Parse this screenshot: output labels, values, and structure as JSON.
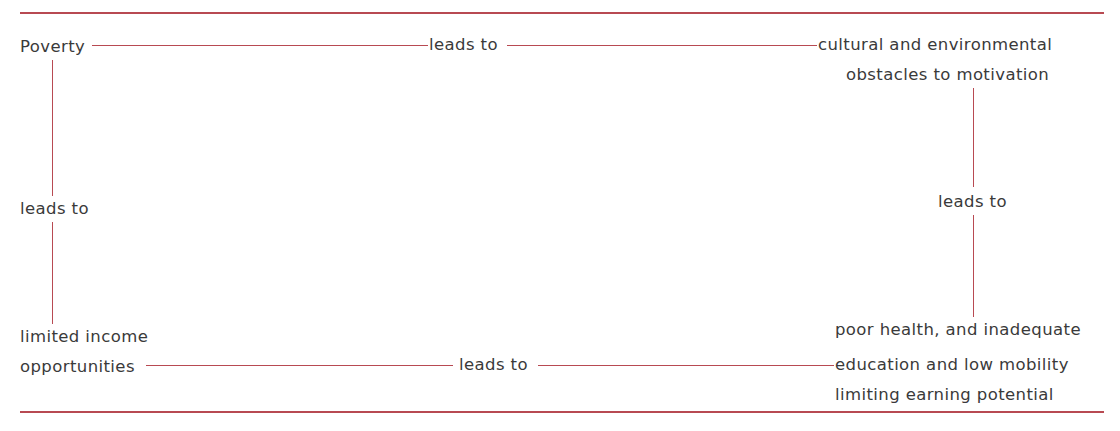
{
  "diagram": {
    "type": "cycle-of-poverty",
    "nodes": {
      "top_left": {
        "text": "Poverty"
      },
      "top_right": {
        "line1": "cultural and environmental",
        "line2": "obstacles to motivation"
      },
      "bottom_right": {
        "line1": "poor health, and inadequate",
        "line2": "education and low mobility",
        "line3": "limiting earning potential"
      },
      "bottom_left": {
        "line1": "limited income",
        "line2": "opportunities"
      }
    },
    "edges": {
      "top": "leads to",
      "right": "leads to",
      "bottom": "leads to",
      "left": "leads to"
    },
    "colors": {
      "line": "#b84a52",
      "text": "#3a3a3a"
    }
  }
}
